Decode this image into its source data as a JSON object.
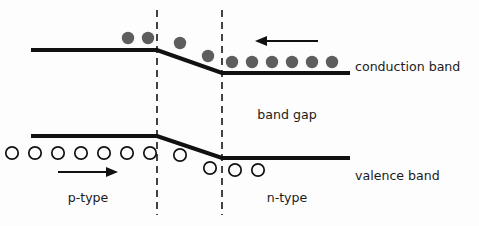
{
  "figure": {
    "title_text": "",
    "width": 479,
    "height": 226,
    "background_color": "#fdfdfd"
  },
  "colors": {
    "band_line": "#111111",
    "electron_fill": "#5d5d5d",
    "hole_stroke": "#111111",
    "dashed_edge": "#151515",
    "text": "#1b1b1b"
  },
  "labels": {
    "conduction_band": "conduction band",
    "valence_band": "valence band",
    "band_gap": "band gap",
    "p_type": "p-type",
    "n_type": "n-type"
  },
  "label_positions": {
    "conduction_band": {
      "x": 355,
      "y": 71
    },
    "valence_band": {
      "x": 355,
      "y": 180
    },
    "band_gap": {
      "x": 287,
      "y": 119
    },
    "p_type": {
      "x": 88,
      "y": 202
    },
    "n_type": {
      "x": 287,
      "y": 202
    }
  },
  "chart_data": {
    "type": "line",
    "xlabel": "",
    "ylabel": "",
    "xlim": [
      0,
      479
    ],
    "ylim": [
      226,
      0
    ],
    "grid": false,
    "legend": "none",
    "note": "y pixel coordinates increase downward; lower y = higher energy",
    "series": [
      {
        "name": "conduction band",
        "kind": "band-edge",
        "points": [
          {
            "x": 31,
            "y": 50
          },
          {
            "x": 157,
            "y": 50
          },
          {
            "x": 222,
            "y": 73
          },
          {
            "x": 350,
            "y": 73
          }
        ]
      },
      {
        "name": "valence band",
        "kind": "band-edge",
        "points": [
          {
            "x": 31,
            "y": 136
          },
          {
            "x": 157,
            "y": 136
          },
          {
            "x": 222,
            "y": 158
          },
          {
            "x": 350,
            "y": 158
          }
        ]
      }
    ],
    "depletion_edges": [
      {
        "name": "p-side depletion edge",
        "x": 157,
        "y_top": 10,
        "y_bottom": 215
      },
      {
        "name": "n-side depletion edge",
        "x": 222,
        "y_top": 10,
        "y_bottom": 215
      }
    ],
    "carriers": {
      "electrons": {
        "symbol": "filled circle",
        "radius": 6.2,
        "count": 10,
        "points": [
          {
            "x": 128,
            "y": 38
          },
          {
            "x": 148,
            "y": 38
          },
          {
            "x": 180,
            "y": 43
          },
          {
            "x": 208,
            "y": 56
          },
          {
            "x": 232,
            "y": 62
          },
          {
            "x": 252,
            "y": 62
          },
          {
            "x": 272,
            "y": 62
          },
          {
            "x": 292,
            "y": 62
          },
          {
            "x": 312,
            "y": 62
          },
          {
            "x": 332,
            "y": 62
          }
        ]
      },
      "holes": {
        "symbol": "open circle",
        "radius": 6.2,
        "count": 11,
        "points": [
          {
            "x": 12,
            "y": 153
          },
          {
            "x": 35,
            "y": 153
          },
          {
            "x": 58,
            "y": 153
          },
          {
            "x": 81,
            "y": 153
          },
          {
            "x": 104,
            "y": 153
          },
          {
            "x": 127,
            "y": 153
          },
          {
            "x": 150,
            "y": 153
          },
          {
            "x": 180,
            "y": 155
          },
          {
            "x": 210,
            "y": 168
          },
          {
            "x": 235,
            "y": 170
          },
          {
            "x": 258,
            "y": 170
          }
        ]
      }
    },
    "arrows": [
      {
        "name": "electron-flow-arrow",
        "direction": "left",
        "x_start": 318,
        "x_end": 255,
        "y": 41
      },
      {
        "name": "hole-flow-arrow",
        "direction": "right",
        "x_start": 58,
        "x_end": 118,
        "y": 172
      }
    ]
  }
}
